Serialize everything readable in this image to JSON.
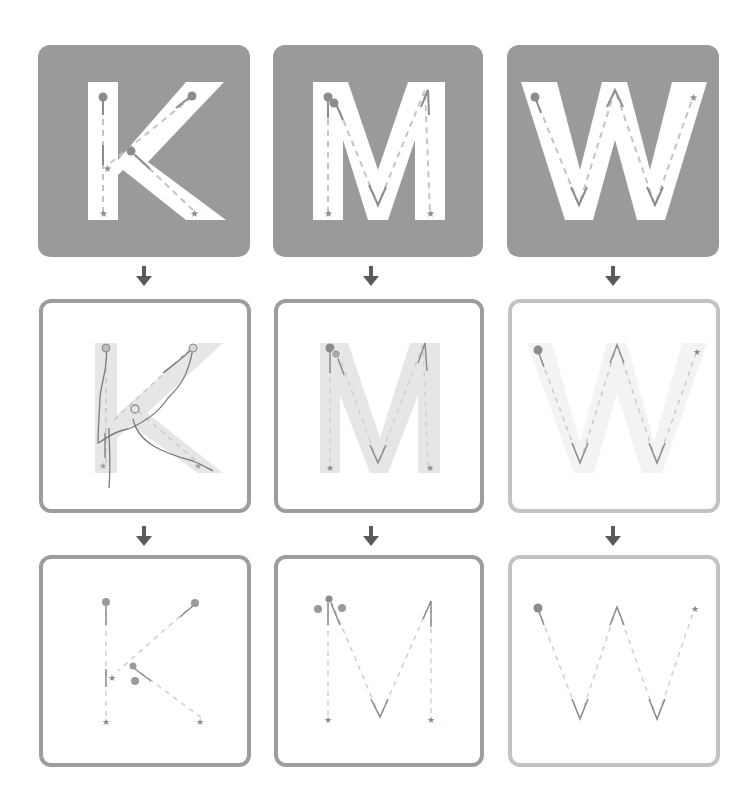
{
  "diagram": {
    "title": "",
    "letters": [
      "K",
      "M",
      "W"
    ],
    "stages": [
      {
        "name": "stroke-guide",
        "description": "Solid letter on grey tile with dashed stroke paths, numbered starts and star ends"
      },
      {
        "name": "traced-attempt",
        "description": "Faded letter outline with user-traced strokes"
      },
      {
        "name": "stroke-skeleton",
        "description": "Dashed stroke paths only with numbered starts and star ends"
      }
    ],
    "columns": [
      {
        "letter": "K",
        "strokes": [
          {
            "order": "1",
            "direction": "top-to-bottom vertical"
          },
          {
            "order": "2",
            "direction": "top-right to middle-left diagonal"
          },
          {
            "order": "3",
            "direction": "middle to bottom-right diagonal"
          }
        ]
      },
      {
        "letter": "M",
        "strokes": [
          {
            "order": "1",
            "direction": "left vertical down"
          },
          {
            "order": "2",
            "direction": "top-left down to valley, up to top-right, down right vertical"
          }
        ]
      },
      {
        "letter": "W",
        "strokes": [
          {
            "order": "1",
            "direction": "single zigzag stroke from top-left to top-right"
          }
        ]
      }
    ],
    "markers": {
      "start": "numbered-circle",
      "end": "star",
      "flow": "down-arrow"
    },
    "colors": {
      "tile": "#9a9a9a",
      "letter_fill": "#ffffff",
      "stroke": "#8c8c8c",
      "dash": "#c4c4c4",
      "border_dark": "#9d9d9d",
      "border_light": "#c3c3c3",
      "faded_letter": "#e6e6e6",
      "arrow": "#5a5a5a"
    }
  }
}
